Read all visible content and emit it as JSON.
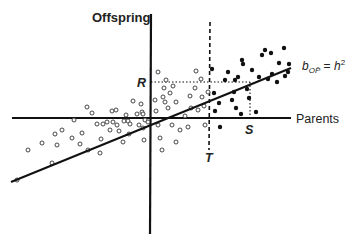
{
  "diagram": {
    "type": "parent-offspring regression (truncation selection)",
    "y_axis_label": "Offspring",
    "x_axis_label": "Parents",
    "regression_label": {
      "b": "b",
      "subscript": "OP̄",
      "equals": " = ",
      "h": "h",
      "superscript": "2"
    },
    "markers": {
      "R": "R",
      "S": "S",
      "T": "T"
    },
    "colors": {
      "ink": "#111111",
      "background": "#ffffff"
    }
  },
  "chart_data": {
    "type": "scatter",
    "title": "",
    "xlabel": "Parents",
    "ylabel": "Offspring",
    "annotations": [
      "R (response to selection)",
      "S (selection differential)",
      "T (truncation point)",
      "b_OP̄ = h²"
    ],
    "origin_px": [
      151,
      118
    ],
    "regression_line_px": [
      [
        11,
        182
      ],
      [
        291,
        68
      ]
    ],
    "truncation_line_x_px": 210,
    "R_y_px": 82,
    "S_x_px": 250,
    "series": [
      {
        "name": "unselected parents (open circles)",
        "points_px": [
          [
            17,
            180
          ],
          [
            28,
            150
          ],
          [
            42,
            143
          ],
          [
            52,
            163
          ],
          [
            57,
            145
          ],
          [
            55,
            134
          ],
          [
            62,
            130
          ],
          [
            72,
            138
          ],
          [
            74,
            120
          ],
          [
            80,
            144
          ],
          [
            82,
            133
          ],
          [
            87,
            107
          ],
          [
            88,
            150
          ],
          [
            92,
            113
          ],
          [
            97,
            124
          ],
          [
            100,
            153
          ],
          [
            101,
            139
          ],
          [
            103,
            124
          ],
          [
            107,
            122
          ],
          [
            110,
            130
          ],
          [
            112,
            111
          ],
          [
            113,
            122
          ],
          [
            116,
            110
          ],
          [
            117,
            125
          ],
          [
            119,
            131
          ],
          [
            123,
            142
          ],
          [
            124,
            121
          ],
          [
            126,
            115
          ],
          [
            128,
            121
          ],
          [
            129,
            134
          ],
          [
            130,
            124
          ],
          [
            133,
            101
          ],
          [
            137,
            114
          ],
          [
            139,
            125
          ],
          [
            141,
            104
          ],
          [
            142,
            112
          ],
          [
            143,
            114
          ],
          [
            143,
            128
          ],
          [
            145,
            120
          ],
          [
            148,
            122
          ],
          [
            144,
            140
          ],
          [
            158,
            72
          ],
          [
            163,
            97
          ],
          [
            164,
            88
          ],
          [
            165,
            102
          ],
          [
            166,
            80
          ],
          [
            170,
            93
          ],
          [
            173,
            86
          ],
          [
            176,
            102
          ],
          [
            155,
            100
          ],
          [
            156,
            111
          ],
          [
            158,
            125
          ],
          [
            160,
            138
          ],
          [
            162,
            150
          ],
          [
            168,
            108
          ],
          [
            172,
            125
          ],
          [
            176,
            142
          ],
          [
            180,
            130
          ],
          [
            185,
            116
          ],
          [
            188,
            127
          ],
          [
            190,
            96
          ],
          [
            191,
            108
          ],
          [
            195,
            88
          ],
          [
            196,
            71
          ],
          [
            198,
            110
          ],
          [
            201,
            79
          ],
          [
            202,
            97
          ],
          [
            204,
            106
          ],
          [
            205,
            125
          ],
          [
            208,
            92
          ]
        ]
      },
      {
        "name": "selected parents (filled circles)",
        "points_px": [
          [
            212,
            69
          ],
          [
            214,
            93
          ],
          [
            215,
            111
          ],
          [
            219,
            103
          ],
          [
            220,
            127
          ],
          [
            225,
            80
          ],
          [
            228,
            72
          ],
          [
            232,
            100
          ],
          [
            234,
            92
          ],
          [
            236,
            108
          ],
          [
            238,
            77
          ],
          [
            242,
            60
          ],
          [
            243,
            64
          ],
          [
            247,
            89
          ],
          [
            249,
            98
          ],
          [
            252,
            70
          ],
          [
            256,
            112
          ],
          [
            259,
            77
          ],
          [
            262,
            55
          ],
          [
            265,
            50
          ],
          [
            268,
            79
          ],
          [
            271,
            53
          ],
          [
            272,
            74
          ],
          [
            277,
            82
          ],
          [
            279,
            63
          ],
          [
            285,
            76
          ],
          [
            288,
            72
          ],
          [
            289,
            64
          ],
          [
            284,
            48
          ],
          [
            235,
            80
          ],
          [
            241,
            114
          ]
        ]
      }
    ]
  }
}
